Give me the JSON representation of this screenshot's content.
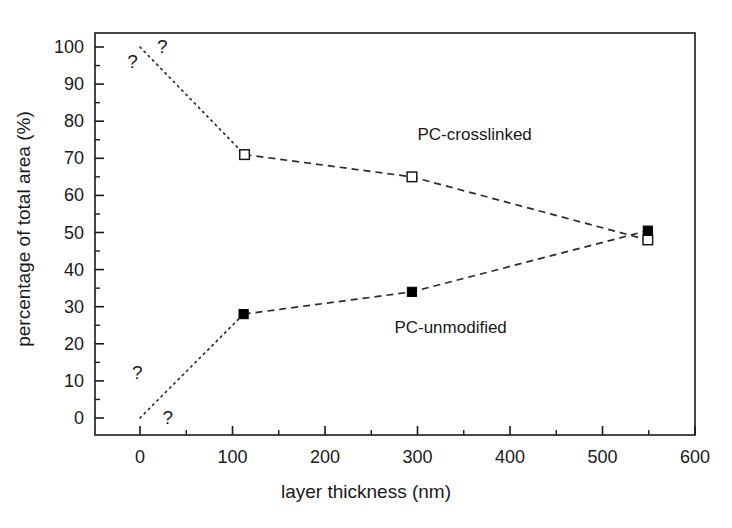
{
  "chart_data": {
    "type": "line",
    "title": "",
    "subtitle": "",
    "xlabel": "layer thickness (nm)",
    "ylabel": "percentage of total area (%)",
    "xlim": [
      -35,
      615
    ],
    "ylim": [
      -5,
      104
    ],
    "xticks": [
      0,
      100,
      200,
      300,
      400,
      500,
      600
    ],
    "xtick_labels": [
      "0",
      "100",
      "200",
      "300",
      "400",
      "500",
      "600"
    ],
    "xminor_step": 50,
    "yticks": [
      0,
      10,
      20,
      30,
      40,
      50,
      60,
      70,
      80,
      90,
      100
    ],
    "ytick_labels": [
      "0",
      "10",
      "20",
      "30",
      "40",
      "50",
      "60",
      "70",
      "80",
      "90",
      "100"
    ],
    "yminor_step": 5,
    "grid": false,
    "legend_position": "inline-annotations",
    "frame": "box",
    "series": [
      {
        "name": "PC-crosslinked",
        "marker": "open-square",
        "line_style": "dashed",
        "label_x": 300,
        "label_y": 76,
        "x": [
          113,
          294,
          549
        ],
        "values": [
          71,
          65,
          48
        ]
      },
      {
        "name": "PC-unmodified",
        "marker": "filled-square",
        "line_style": "dashed",
        "label_x": 275,
        "label_y": 24,
        "x": [
          112,
          294,
          549
        ],
        "values": [
          28,
          34,
          50.5
        ]
      }
    ],
    "extrapolations": [
      {
        "name": "PC-crosslinked-extrapolated",
        "line_style": "dotted",
        "x": [
          0,
          113
        ],
        "values": [
          100,
          71
        ]
      },
      {
        "name": "PC-unmodified-extrapolated",
        "line_style": "dotted",
        "x": [
          0,
          112
        ],
        "values": [
          0,
          28
        ]
      }
    ],
    "annotations": [
      {
        "text": "?",
        "x": -8,
        "y": 96
      },
      {
        "text": "?",
        "x": 24,
        "y": 100
      },
      {
        "text": "?",
        "x": -3,
        "y": 12
      },
      {
        "text": "?",
        "x": 30,
        "y": 0
      }
    ],
    "colors": {
      "axis": "#1a1a1a",
      "marker_fill": "#000000",
      "marker_open_fill": "#ffffff",
      "line": "#2b2b2b",
      "background": "#ffffff"
    }
  }
}
